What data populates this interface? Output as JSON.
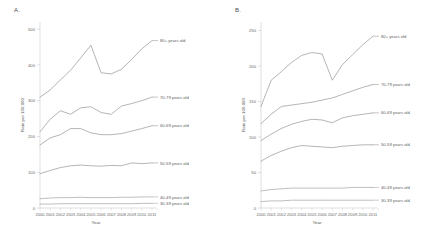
{
  "figure": {
    "panels": [
      {
        "letter": "A.",
        "ylabel": "Rate per 100,000",
        "xlabel": "Year"
      },
      {
        "letter": "B.",
        "ylabel": "Rate per 100,000",
        "xlabel": "Year"
      }
    ]
  },
  "chart_data": [
    {
      "type": "line",
      "title": "A.",
      "xlabel": "Year",
      "ylabel": "Rate per 100,000",
      "x": [
        2000,
        2001,
        2002,
        2003,
        2004,
        2005,
        2006,
        2007,
        2008,
        2009,
        2010,
        2011
      ],
      "xticklabels": [
        "2000",
        "2001",
        "2002",
        "2003",
        "2004",
        "2005",
        "2006",
        "2007",
        "2008",
        "2009",
        "2010",
        "2011"
      ],
      "yticks": [
        0,
        100,
        200,
        300,
        400,
        500
      ],
      "yticklabels": [
        "0",
        "100",
        "200",
        "300",
        "400",
        "500"
      ],
      "ylim": [
        0,
        520
      ],
      "xlim": [
        2000,
        2011
      ],
      "grid": false,
      "legend_position": "right-inline",
      "series": [
        {
          "name": "80+ years old",
          "label": "80+ years old",
          "color": "#8c8c8c",
          "values": [
            310,
            330,
            358,
            385,
            420,
            455,
            378,
            375,
            388,
            415,
            445,
            468
          ]
        },
        {
          "name": "70-79 years old",
          "label": "70-79 years old",
          "color": "#8c8c8c",
          "values": [
            213,
            248,
            272,
            262,
            280,
            283,
            267,
            262,
            285,
            292,
            300,
            310
          ]
        },
        {
          "name": "60-69 years old",
          "label": "60-69 years old",
          "color": "#8c8c8c",
          "values": [
            176,
            196,
            205,
            222,
            222,
            210,
            205,
            205,
            208,
            215,
            222,
            230
          ]
        },
        {
          "name": "50-59 years old",
          "label": "50-59 years old",
          "color": "#8c8c8c",
          "values": [
            96,
            105,
            113,
            118,
            120,
            118,
            117,
            119,
            118,
            126,
            124,
            126
          ]
        },
        {
          "name": "40-49 years old",
          "label": "40-49 years old",
          "color": "#9a9a9a",
          "values": [
            26,
            28,
            29,
            29,
            30,
            29,
            29,
            29,
            30,
            30,
            31,
            31
          ]
        },
        {
          "name": "30-39 years old",
          "label": "30-39 years old",
          "color": "#9a9a9a",
          "values": [
            11,
            11,
            12,
            12,
            12,
            12,
            12,
            12,
            12,
            12,
            13,
            13
          ]
        }
      ]
    },
    {
      "type": "line",
      "title": "B.",
      "xlabel": "Year",
      "ylabel": "Rate per 100,000",
      "x": [
        2000,
        2001,
        2002,
        2003,
        2004,
        2005,
        2006,
        2007,
        2008,
        2009,
        2010,
        2011
      ],
      "xticklabels": [
        "2000",
        "2001",
        "2002",
        "2003",
        "2004",
        "2005",
        "2006",
        "2007",
        "2008",
        "2009",
        "2010",
        "2011"
      ],
      "yticks": [
        0,
        50,
        100,
        150,
        200,
        250
      ],
      "yticklabels": [
        "0",
        "50",
        "100",
        "150",
        "200",
        "250"
      ],
      "ylim": [
        0,
        262
      ],
      "xlim": [
        2000,
        2011
      ],
      "grid": false,
      "legend_position": "right-inline",
      "series": [
        {
          "name": "80+ years old",
          "label": "80+ years old",
          "color": "#8c8c8c",
          "values": [
            143,
            180,
            192,
            205,
            215,
            219,
            217,
            180,
            202,
            216,
            230,
            242
          ]
        },
        {
          "name": "70-79 years old",
          "label": "70-79 years old",
          "color": "#8c8c8c",
          "values": [
            119,
            132,
            143,
            145,
            147,
            149,
            152,
            155,
            160,
            165,
            170,
            174
          ]
        },
        {
          "name": "60-69 years old",
          "label": "60-69 years old",
          "color": "#8c8c8c",
          "values": [
            95,
            104,
            112,
            118,
            122,
            125,
            124,
            120,
            127,
            130,
            132,
            134
          ]
        },
        {
          "name": "50-59 years old",
          "label": "50-59 years old",
          "color": "#8c8c8c",
          "values": [
            66,
            74,
            80,
            85,
            88,
            87,
            86,
            85,
            87,
            88,
            89,
            89
          ]
        },
        {
          "name": "40-49 years old",
          "label": "40-49 years old",
          "color": "#9a9a9a",
          "values": [
            24,
            26,
            27,
            28,
            28,
            28,
            28,
            28,
            28,
            29,
            29,
            29
          ]
        },
        {
          "name": "30-39 years old",
          "label": "30-39 years old",
          "color": "#9a9a9a",
          "values": [
            9,
            10,
            10,
            11,
            11,
            11,
            11,
            11,
            11,
            11,
            11,
            11
          ]
        }
      ]
    }
  ]
}
